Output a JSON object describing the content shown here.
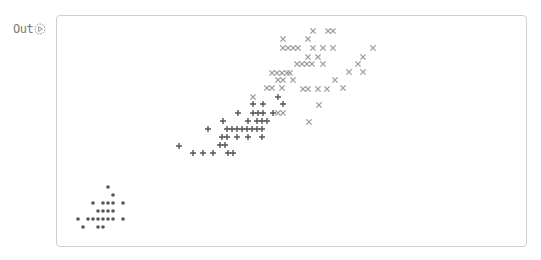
{
  "cell": {
    "prompt_label": "Out",
    "prompt_icon": "run-output-icon"
  },
  "colors": {
    "card_border": "#cfcfcf",
    "series_dot": "#555555",
    "series_plus": "#555555",
    "series_x": "#9a9a9a"
  },
  "chart_data": {
    "type": "scatter",
    "title": "",
    "xlabel": "",
    "ylabel": "",
    "axes_visible": false,
    "grid": false,
    "legend": null,
    "note": "Coordinates are screen pixels (x,y) of marker centers; no axes or ticks are shown.",
    "series": [
      {
        "name": "dot",
        "marker": "o",
        "color": "#555555",
        "points": [
          [
            108,
            187
          ],
          [
            113,
            195
          ],
          [
            93,
            203
          ],
          [
            103,
            203
          ],
          [
            108,
            203
          ],
          [
            113,
            203
          ],
          [
            123,
            203
          ],
          [
            98,
            211
          ],
          [
            103,
            211
          ],
          [
            108,
            211
          ],
          [
            113,
            211
          ],
          [
            78,
            219
          ],
          [
            88,
            219
          ],
          [
            93,
            219
          ],
          [
            98,
            219
          ],
          [
            103,
            219
          ],
          [
            108,
            219
          ],
          [
            113,
            219
          ],
          [
            123,
            219
          ],
          [
            83,
            227
          ],
          [
            98,
            227
          ],
          [
            103,
            227
          ]
        ]
      },
      {
        "name": "plus",
        "marker": "+",
        "color": "#555555",
        "points": [
          [
            278,
            97
          ],
          [
            253,
            104
          ],
          [
            263,
            104
          ],
          [
            283,
            104
          ],
          [
            238,
            113
          ],
          [
            253,
            113
          ],
          [
            258,
            113
          ],
          [
            263,
            113
          ],
          [
            273,
            113
          ],
          [
            223,
            121
          ],
          [
            248,
            121
          ],
          [
            257,
            121
          ],
          [
            262,
            121
          ],
          [
            267,
            121
          ],
          [
            208,
            129
          ],
          [
            227,
            129
          ],
          [
            232,
            129
          ],
          [
            237,
            129
          ],
          [
            242,
            129
          ],
          [
            247,
            129
          ],
          [
            252,
            129
          ],
          [
            257,
            129
          ],
          [
            262,
            129
          ],
          [
            222,
            137
          ],
          [
            227,
            137
          ],
          [
            237,
            137
          ],
          [
            248,
            137
          ],
          [
            262,
            137
          ],
          [
            179,
            146
          ],
          [
            220,
            145
          ],
          [
            225,
            145
          ],
          [
            193,
            153
          ],
          [
            203,
            153
          ],
          [
            213,
            153
          ],
          [
            228,
            153
          ],
          [
            233,
            153
          ]
        ]
      },
      {
        "name": "x",
        "marker": "x",
        "color": "#9a9a9a",
        "points": [
          [
            313,
            31
          ],
          [
            328,
            31
          ],
          [
            333,
            31
          ],
          [
            283,
            39
          ],
          [
            308,
            39
          ],
          [
            283,
            48
          ],
          [
            288,
            48
          ],
          [
            293,
            48
          ],
          [
            298,
            48
          ],
          [
            313,
            48
          ],
          [
            323,
            48
          ],
          [
            333,
            48
          ],
          [
            373,
            48
          ],
          [
            308,
            57
          ],
          [
            318,
            57
          ],
          [
            363,
            57
          ],
          [
            297,
            64
          ],
          [
            302,
            64
          ],
          [
            307,
            64
          ],
          [
            312,
            64
          ],
          [
            323,
            64
          ],
          [
            358,
            64
          ],
          [
            272,
            73
          ],
          [
            277,
            73
          ],
          [
            282,
            73
          ],
          [
            287,
            73
          ],
          [
            290,
            73
          ],
          [
            349,
            72
          ],
          [
            363,
            72
          ],
          [
            278,
            80
          ],
          [
            283,
            80
          ],
          [
            293,
            80
          ],
          [
            335,
            80
          ],
          [
            267,
            88
          ],
          [
            272,
            88
          ],
          [
            282,
            88
          ],
          [
            303,
            89
          ],
          [
            308,
            89
          ],
          [
            318,
            89
          ],
          [
            327,
            89
          ],
          [
            343,
            88
          ],
          [
            253,
            97
          ],
          [
            319,
            105
          ],
          [
            278,
            113
          ],
          [
            283,
            113
          ],
          [
            309,
            122
          ]
        ]
      }
    ]
  }
}
